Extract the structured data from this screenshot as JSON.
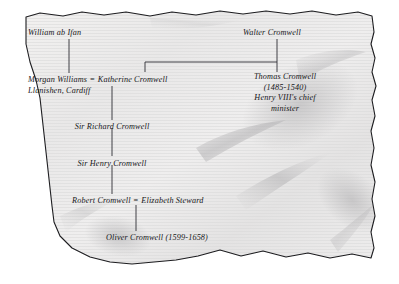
{
  "document": {
    "kind": "parchment-family-tree",
    "title_text": "",
    "background_color": "#ffffff",
    "parchment_color": "#eceaea",
    "parchment_edge_color": "#1d1d20",
    "ink_color": "#17171a",
    "line_color": "#2e2e33"
  },
  "tree": {
    "nodes": [
      {
        "id": "william-ab-ifan",
        "label": "William ab Ifan",
        "align": "left",
        "x": 28,
        "y": 28
      },
      {
        "id": "walter-cromwell",
        "label": "Walter Cromwell",
        "align": "left",
        "x": 243,
        "y": 28
      },
      {
        "id": "sir-richard-cromwell",
        "label": "Sir Richard Cromwell",
        "align": "center",
        "x": 112,
        "y": 122
      },
      {
        "id": "sir-henry-cromwell",
        "label": "Sir Henry Cromwell",
        "align": "center",
        "x": 112,
        "y": 159
      },
      {
        "id": "oliver-cromwell",
        "label": "Oliver Cromwell (1599-1658)",
        "align": "center",
        "x": 157,
        "y": 233
      }
    ],
    "multiline_nodes": [
      {
        "id": "thomas-cromwell",
        "align": "center",
        "x": 285,
        "y": 72,
        "lines": [
          "Thomas Cromwell",
          "(1485-1540)",
          "Henry VIII's chief",
          "minister"
        ]
      }
    ],
    "marriages": [
      {
        "id": "morgan-katherine",
        "left_label": "Morgan Williams",
        "equals": "=",
        "right_label": "Katherine Cromwell",
        "sub_label": "Llanishen, Cardiff",
        "x": 28,
        "y": 75
      },
      {
        "id": "robert-elizabeth",
        "left_label": "Robert Cromwell",
        "equals": "=",
        "right_label": "Elizabeth Steward",
        "sub_label": "",
        "x": 72,
        "y": 196
      }
    ],
    "connectors": [
      {
        "id": "william-to-morgan",
        "type": "vertical",
        "x": 69,
        "y1": 39,
        "y2": 73
      },
      {
        "id": "walter-to-bar",
        "type": "vertical",
        "x": 277,
        "y1": 39,
        "y2": 62
      },
      {
        "id": "walter-children-bar",
        "type": "horizontal",
        "y": 62,
        "x1": 145,
        "x2": 277
      },
      {
        "id": "bar-to-katherine",
        "type": "vertical",
        "x": 145,
        "y1": 62,
        "y2": 72
      },
      {
        "id": "bar-to-thomas",
        "type": "vertical",
        "x": 277,
        "y1": 62,
        "y2": 72
      },
      {
        "id": "katherine-to-richard",
        "type": "vertical",
        "x": 112,
        "y1": 86,
        "y2": 120
      },
      {
        "id": "richard-to-henry",
        "type": "vertical",
        "x": 112,
        "y1": 128,
        "y2": 156
      },
      {
        "id": "henry-to-robert",
        "type": "vertical",
        "x": 112,
        "y1": 165,
        "y2": 194
      },
      {
        "id": "robert-to-oliver",
        "type": "vertical",
        "x": 136,
        "y1": 205,
        "y2": 231
      }
    ]
  },
  "parchment": {
    "outline_path": "M 26,17 L 40,13 L 63,16 L 82,12 L 104,15 L 126,12 L 150,16 L 172,12 L 196,15 L 220,11 L 243,14 L 266,11 L 290,14 L 312,11 L 336,15 L 358,12 L 372,16 L 374,32 L 371,44 L 375,58 L 372,72 L 376,86 L 372,100 L 375,116 L 371,131 L 374,148 L 371,165 L 375,182 L 372,199 L 375,216 L 371,232 L 374,248 L 371,258 L 352,254 L 330,258 L 308,253 L 286,257 L 263,251 L 241,256 L 220,250 L 198,256 L 176,260 L 154,262 L 132,264 L 110,262 L 90,257 L 72,248 L 60,236 L 54,222 L 52,206 L 50,188 L 48,170 L 46,152 L 44,134 L 42,116 L 40,98 L 36,80 L 30,62 L 26,44 Z"
  }
}
